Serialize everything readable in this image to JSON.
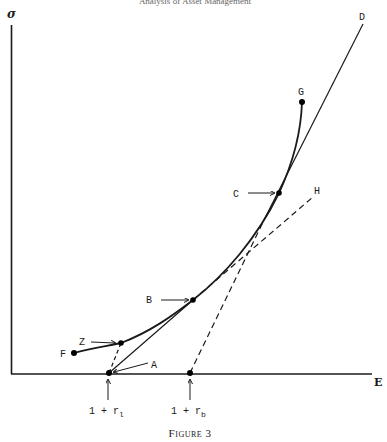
{
  "header": {
    "partial_text": "Analysis of Asset Management"
  },
  "axes": {
    "y_label": "σ",
    "x_label": "E"
  },
  "points": {
    "A": "A",
    "B": "B",
    "C": "C",
    "D": "D",
    "F": "F",
    "G": "G",
    "H": "H",
    "Z": "Z"
  },
  "x_markers": [
    {
      "id": "r_l",
      "prefix": "1 + r",
      "subscript": "l"
    },
    {
      "id": "r_b",
      "prefix": "1 + r",
      "subscript": "b"
    }
  ],
  "caption": "Figure 3",
  "colors": {
    "ink": "#1a1a1a",
    "background": "#ffffff"
  }
}
